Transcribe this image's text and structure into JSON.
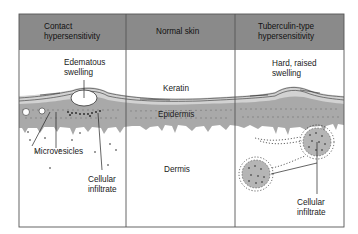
{
  "figure": {
    "panels": [
      {
        "id": "contact",
        "header": {
          "line1": "Contact",
          "line2": "hypersensitivity"
        },
        "labels": {
          "edematous_line1": "Edematous",
          "edematous_line2": "swelling",
          "microvesicles": "Microvesicles",
          "cellular_line1": "Cellular",
          "cellular_line2": "infiltrate"
        }
      },
      {
        "id": "normal",
        "header": {
          "line1": "Normal skin"
        },
        "labels": {
          "keratin": "Keratin",
          "epidermis": "Epidermis",
          "dermis": "Dermis"
        }
      },
      {
        "id": "tuberculin",
        "header": {
          "line1": "Tuberculin-type",
          "line2": "hypersensitivity"
        },
        "labels": {
          "hard_line1": "Hard, raised",
          "hard_line2": "swelling",
          "cellular_line1": "Cellular",
          "cellular_line2": "infiltrate"
        }
      }
    ],
    "colors": {
      "header_bg": "#8a8a8a",
      "frame": "#555555",
      "epidermis": "#a9a9a9",
      "keratin_band": "#d2d2d2",
      "background": "#ffffff"
    }
  }
}
